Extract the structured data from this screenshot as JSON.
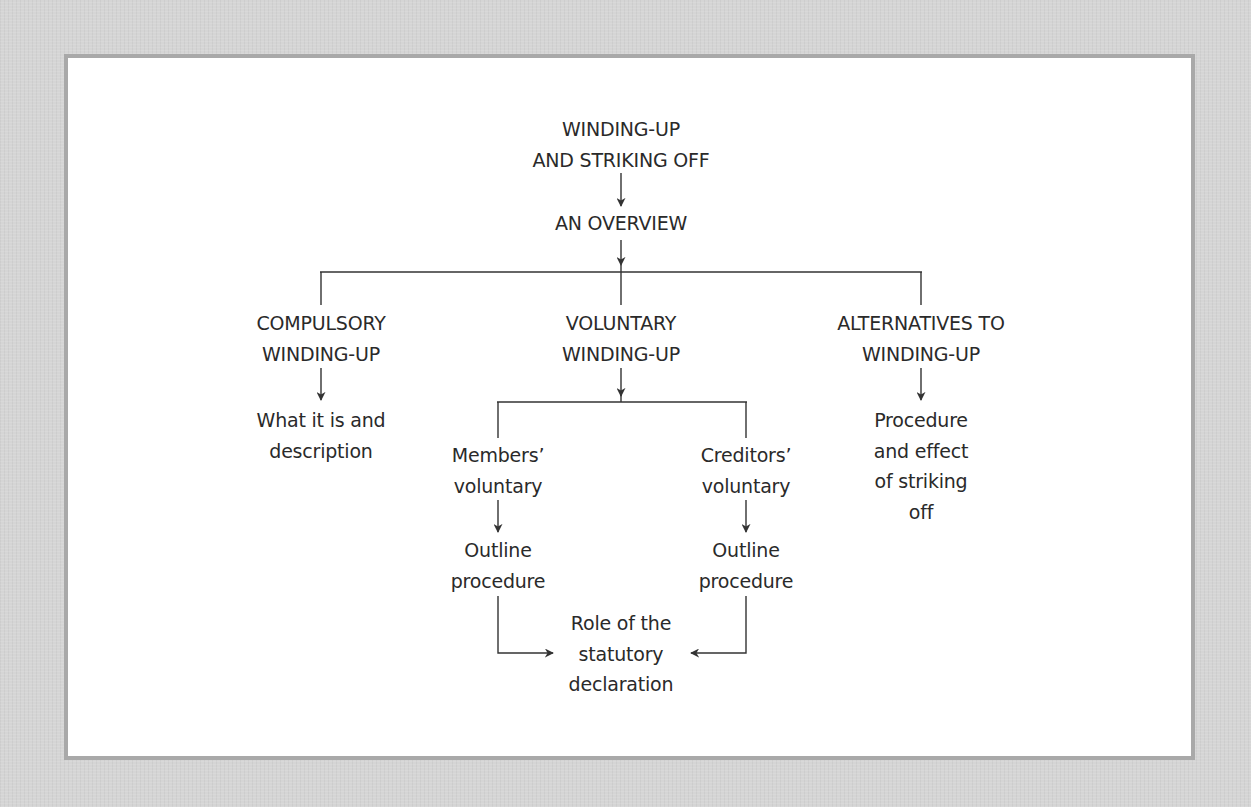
{
  "diagram": {
    "title": {
      "lines": [
        "WINDING-UP",
        "AND STRIKING OFF"
      ]
    },
    "overview": {
      "lines": [
        "AN OVERVIEW"
      ]
    },
    "branches": [
      {
        "id": "compulsory",
        "heading": [
          "COMPULSORY",
          "WINDING-UP"
        ],
        "detail": [
          "What it is and",
          "description"
        ]
      },
      {
        "id": "voluntary",
        "heading": [
          "VOLUNTARY",
          "WINDING-UP"
        ],
        "sub": [
          {
            "id": "members",
            "label": [
              "Members’",
              "voluntary"
            ],
            "detail": [
              "Outline",
              "procedure"
            ]
          },
          {
            "id": "creditors",
            "label": [
              "Creditors’",
              "voluntary"
            ],
            "detail": [
              "Outline",
              "procedure"
            ]
          }
        ],
        "merge": [
          "Role of the",
          "statutory",
          "declaration"
        ]
      },
      {
        "id": "alternatives",
        "heading": [
          "ALTERNATIVES TO",
          "WINDING-UP"
        ],
        "detail": [
          "Procedure",
          "and effect",
          "of striking",
          "off"
        ]
      }
    ],
    "colors": {
      "background": "#d5d5d5",
      "panel": "#ffffff",
      "panel_border": "#a9a9a9",
      "text": "#2a2a2a",
      "line": "#333333"
    }
  }
}
